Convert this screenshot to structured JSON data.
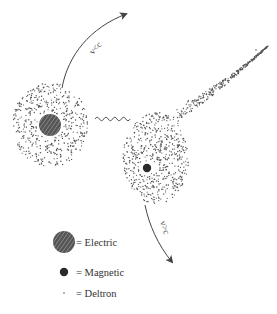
{
  "diagram": {
    "colors": {
      "background": "#ffffff",
      "dot": "#555555",
      "electric_fill": "#555555",
      "electric_hatch": "#9a9a9a",
      "magnetic_fill": "#2b2b2b",
      "line": "#444444"
    },
    "left_particle": {
      "core": "electric",
      "cloud": "deltron",
      "arrow_label": "v<c"
    },
    "right_particle": {
      "core": "magnetic",
      "cloud": "deltron-teardrop",
      "arrow_label": "v>c"
    },
    "interaction": "wavy-line"
  },
  "legend": {
    "items": [
      {
        "symbol": "electric",
        "label": "= Electric"
      },
      {
        "symbol": "magnetic",
        "label": "= Magnetic"
      },
      {
        "symbol": "deltron",
        "label": "= Deltron"
      }
    ]
  }
}
